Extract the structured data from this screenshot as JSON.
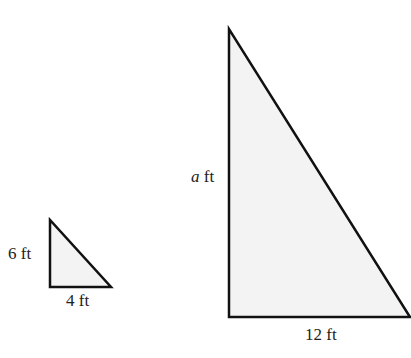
{
  "colors": {
    "stroke": "#111111",
    "fill": "#f3f3f3",
    "text": "#222222"
  },
  "small_triangle": {
    "vertices": {
      "top": [
        50,
        220
      ],
      "bottom_left": [
        50,
        287
      ],
      "bottom_right": [
        111,
        287
      ]
    },
    "height_label": "6 ft",
    "base_label": "4 ft"
  },
  "large_triangle": {
    "vertices": {
      "top": [
        229,
        29
      ],
      "bottom_left": [
        229,
        317
      ],
      "bottom_right": [
        410,
        317
      ]
    },
    "height_label_var": "a",
    "height_label_unit": " ft",
    "base_label": "12 ft"
  }
}
